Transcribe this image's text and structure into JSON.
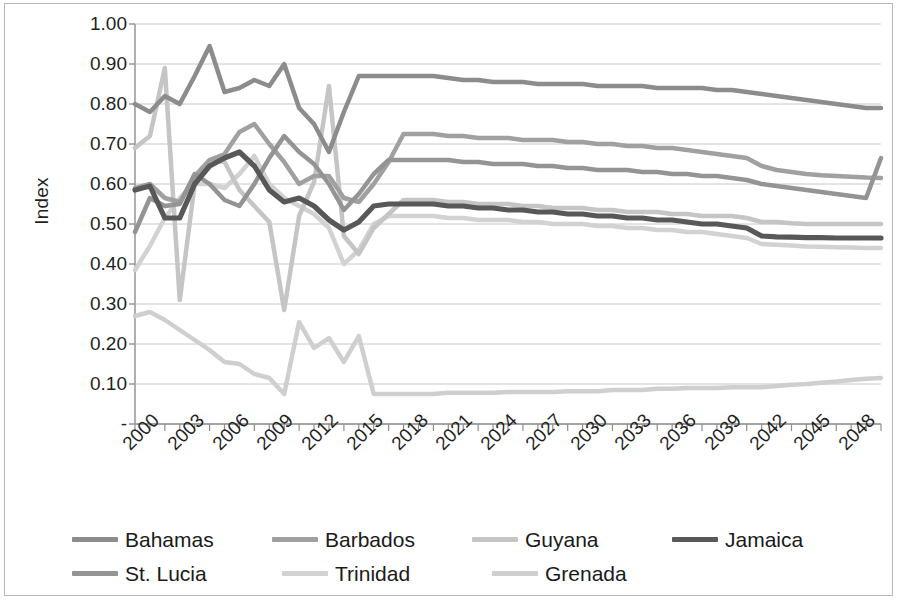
{
  "chart_data": {
    "type": "line",
    "title": "",
    "xlabel": "",
    "ylabel": "Index",
    "ylim": [
      0,
      1.0
    ],
    "ytick_labels": [
      "1.00",
      "0.90",
      "0.80",
      "0.70",
      "0.60",
      "0.50",
      "0.40",
      "0.30",
      "0.20",
      "0.10",
      "-"
    ],
    "ytick_values": [
      1.0,
      0.9,
      0.8,
      0.7,
      0.6,
      0.5,
      0.4,
      0.3,
      0.2,
      0.1,
      0.0
    ],
    "grid": true,
    "legend_position": "bottom",
    "xlim": [
      2000,
      2050
    ],
    "xtick_labels": [
      "2000",
      "2003",
      "2006",
      "2009",
      "2012",
      "2015",
      "2018",
      "2021",
      "2024",
      "2027",
      "2030",
      "2033",
      "2036",
      "2039",
      "2042",
      "2045",
      "2048"
    ],
    "xtick_values": [
      2000,
      2003,
      2006,
      2009,
      2012,
      2015,
      2018,
      2021,
      2024,
      2027,
      2030,
      2033,
      2036,
      2039,
      2042,
      2045,
      2048
    ],
    "x": [
      2000,
      2001,
      2002,
      2003,
      2004,
      2005,
      2006,
      2007,
      2008,
      2009,
      2010,
      2011,
      2012,
      2013,
      2014,
      2015,
      2016,
      2017,
      2018,
      2019,
      2020,
      2021,
      2022,
      2023,
      2024,
      2025,
      2026,
      2027,
      2028,
      2029,
      2030,
      2031,
      2032,
      2033,
      2034,
      2035,
      2036,
      2037,
      2038,
      2039,
      2040,
      2041,
      2042,
      2043,
      2044,
      2045,
      2046,
      2047,
      2048,
      2049,
      2050
    ],
    "series": [
      {
        "name": "Bahamas",
        "color": "#8c8c8c",
        "width": 4.5,
        "values": [
          0.8,
          0.78,
          0.82,
          0.8,
          0.87,
          0.945,
          0.83,
          0.84,
          0.86,
          0.845,
          0.9,
          0.79,
          0.75,
          0.68,
          0.78,
          0.87,
          0.87,
          0.87,
          0.87,
          0.87,
          0.87,
          0.865,
          0.86,
          0.86,
          0.855,
          0.855,
          0.855,
          0.85,
          0.85,
          0.85,
          0.85,
          0.845,
          0.845,
          0.845,
          0.845,
          0.84,
          0.84,
          0.84,
          0.84,
          0.835,
          0.835,
          0.83,
          0.825,
          0.82,
          0.815,
          0.81,
          0.805,
          0.8,
          0.795,
          0.79,
          0.79
        ]
      },
      {
        "name": "Barbados",
        "color": "#a0a0a0",
        "width": 4.5,
        "values": [
          0.59,
          0.6,
          0.565,
          0.555,
          0.62,
          0.66,
          0.675,
          0.73,
          0.75,
          0.7,
          0.655,
          0.6,
          0.62,
          0.62,
          0.565,
          0.555,
          0.6,
          0.655,
          0.725,
          0.725,
          0.725,
          0.72,
          0.72,
          0.715,
          0.715,
          0.715,
          0.71,
          0.71,
          0.71,
          0.705,
          0.705,
          0.7,
          0.7,
          0.695,
          0.695,
          0.69,
          0.69,
          0.685,
          0.68,
          0.675,
          0.67,
          0.665,
          0.645,
          0.635,
          0.63,
          0.625,
          0.622,
          0.62,
          0.618,
          0.616,
          0.615
        ]
      },
      {
        "name": "Guyana",
        "color": "#c5c5c5",
        "width": 4.5,
        "values": [
          0.69,
          0.72,
          0.89,
          0.31,
          0.6,
          0.66,
          0.655,
          0.585,
          0.545,
          0.505,
          0.285,
          0.52,
          0.605,
          0.845,
          0.47,
          0.425,
          0.49,
          0.525,
          0.56,
          0.56,
          0.56,
          0.555,
          0.555,
          0.55,
          0.55,
          0.55,
          0.545,
          0.545,
          0.54,
          0.54,
          0.54,
          0.535,
          0.535,
          0.53,
          0.53,
          0.53,
          0.525,
          0.525,
          0.52,
          0.52,
          0.52,
          0.515,
          0.505,
          0.505,
          0.502,
          0.5,
          0.5,
          0.5,
          0.5,
          0.5,
          0.5
        ]
      },
      {
        "name": "Jamaica",
        "color": "#585858",
        "width": 5.2,
        "values": [
          0.585,
          0.595,
          0.515,
          0.515,
          0.6,
          0.645,
          0.665,
          0.68,
          0.645,
          0.585,
          0.555,
          0.565,
          0.545,
          0.51,
          0.485,
          0.505,
          0.545,
          0.55,
          0.55,
          0.55,
          0.55,
          0.545,
          0.545,
          0.54,
          0.54,
          0.535,
          0.535,
          0.53,
          0.53,
          0.525,
          0.525,
          0.52,
          0.52,
          0.515,
          0.515,
          0.51,
          0.51,
          0.505,
          0.5,
          0.5,
          0.495,
          0.49,
          0.47,
          0.468,
          0.467,
          0.466,
          0.466,
          0.465,
          0.465,
          0.465,
          0.465
        ]
      },
      {
        "name": "St. Lucia",
        "color": "#949494",
        "width": 4.5,
        "values": [
          0.48,
          0.565,
          0.545,
          0.55,
          0.625,
          0.6,
          0.56,
          0.545,
          0.6,
          0.665,
          0.72,
          0.68,
          0.65,
          0.6,
          0.535,
          0.575,
          0.625,
          0.66,
          0.66,
          0.66,
          0.66,
          0.66,
          0.655,
          0.655,
          0.65,
          0.65,
          0.65,
          0.645,
          0.645,
          0.64,
          0.64,
          0.635,
          0.635,
          0.635,
          0.63,
          0.63,
          0.625,
          0.625,
          0.62,
          0.62,
          0.615,
          0.61,
          0.6,
          0.595,
          0.59,
          0.585,
          0.58,
          0.575,
          0.57,
          0.565,
          0.665
        ]
      },
      {
        "name": "Trinidad",
        "color": "#d2d2d2",
        "width": 4.5,
        "values": [
          0.385,
          0.445,
          0.515,
          0.565,
          0.6,
          0.6,
          0.59,
          0.625,
          0.67,
          0.6,
          0.565,
          0.545,
          0.525,
          0.49,
          0.4,
          0.435,
          0.5,
          0.52,
          0.52,
          0.52,
          0.52,
          0.515,
          0.515,
          0.51,
          0.51,
          0.51,
          0.505,
          0.505,
          0.5,
          0.5,
          0.5,
          0.495,
          0.495,
          0.49,
          0.49,
          0.485,
          0.485,
          0.48,
          0.48,
          0.475,
          0.47,
          0.465,
          0.45,
          0.448,
          0.446,
          0.444,
          0.443,
          0.442,
          0.441,
          0.44,
          0.44
        ]
      },
      {
        "name": "Grenada",
        "color": "#cfcfcf",
        "width": 4.5,
        "values": [
          0.27,
          0.28,
          0.26,
          0.235,
          0.21,
          0.185,
          0.155,
          0.15,
          0.125,
          0.115,
          0.075,
          0.255,
          0.19,
          0.215,
          0.155,
          0.22,
          0.075,
          0.075,
          0.075,
          0.075,
          0.075,
          0.078,
          0.078,
          0.078,
          0.078,
          0.08,
          0.08,
          0.08,
          0.08,
          0.082,
          0.082,
          0.082,
          0.085,
          0.085,
          0.085,
          0.088,
          0.088,
          0.09,
          0.09,
          0.09,
          0.092,
          0.092,
          0.092,
          0.095,
          0.098,
          0.1,
          0.103,
          0.106,
          0.11,
          0.113,
          0.115
        ]
      }
    ]
  },
  "legend": {
    "rows": [
      [
        {
          "label": "Bahamas",
          "color": "#8c8c8c"
        },
        {
          "label": "Barbados",
          "color": "#a0a0a0"
        },
        {
          "label": "Guyana",
          "color": "#c5c5c5"
        },
        {
          "label": "Jamaica",
          "color": "#585858"
        }
      ],
      [
        {
          "label": "St. Lucia",
          "color": "#949494"
        },
        {
          "label": "Trinidad",
          "color": "#d2d2d2"
        },
        {
          "label": "Grenada",
          "color": "#cfcfcf"
        }
      ]
    ]
  },
  "colors": {
    "grid": "#c8c8c8",
    "axis": "#8f8f8f",
    "frame": "#b9b9b9",
    "text": "#1f1f1f"
  }
}
